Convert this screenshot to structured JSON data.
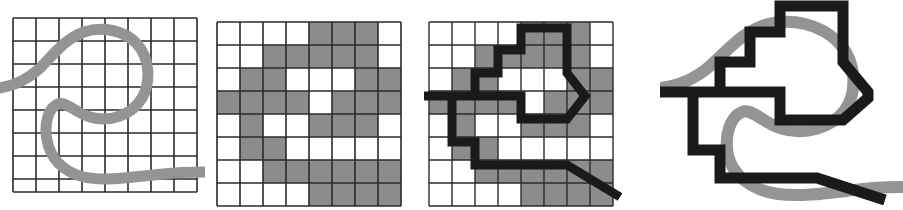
{
  "figure": {
    "panel_count": 4,
    "background_color": "#ffffff"
  },
  "colors": {
    "grid_line": "#2b2b2b",
    "curve_gray": "#949494",
    "cell_fill_gray": "#8c8c8c",
    "polyline_black": "#1a1a1a",
    "background": "#ffffff"
  },
  "panels": [
    {
      "id": "panel-1",
      "name": "original-curve-on-grid",
      "label": "Original curve over grid",
      "grid": {
        "cols": 8,
        "rows": 8,
        "cell": 23,
        "x": 13,
        "y": 18,
        "show_lines": true
      },
      "shows": [
        "grid",
        "gray-curve"
      ]
    },
    {
      "id": "panel-2",
      "name": "rasterized-cells",
      "label": "Rasterized cells",
      "grid": {
        "cols": 8,
        "rows": 8,
        "cell": 23,
        "x": 217,
        "y": 22,
        "show_lines": true
      },
      "shows": [
        "grid",
        "filled-cells"
      ]
    },
    {
      "id": "panel-3",
      "name": "traced-polyline-on-cells",
      "label": "Boundary polyline over rasterized cells",
      "grid": {
        "cols": 8,
        "rows": 8,
        "cell": 23,
        "x": 429,
        "y": 22,
        "show_lines": true
      },
      "shows": [
        "grid",
        "filled-cells",
        "black-polyline",
        "gray-curve"
      ]
    },
    {
      "id": "panel-4",
      "name": "result-overlay",
      "label": "Result: polyline and original curve",
      "grid": {
        "cols": 8,
        "rows": 8,
        "cell": 23,
        "x": 0,
        "y": 0,
        "show_lines": false
      },
      "shows": [
        "gray-curve",
        "black-polyline"
      ]
    }
  ],
  "chart_data": {
    "type": "diagram",
    "grid": {
      "cols": 8,
      "rows": 8,
      "cell_size": 23
    },
    "curve_stroke_width": 11,
    "polyline_stroke_width": 9,
    "filled_cells": [
      [
        0,
        0,
        0,
        0,
        1,
        1,
        1,
        0
      ],
      [
        0,
        0,
        1,
        1,
        1,
        1,
        1,
        0
      ],
      [
        0,
        1,
        1,
        0,
        0,
        0,
        1,
        1
      ],
      [
        1,
        1,
        1,
        1,
        0,
        1,
        1,
        1
      ],
      [
        0,
        1,
        0,
        0,
        1,
        1,
        1,
        0
      ],
      [
        0,
        1,
        1,
        0,
        0,
        0,
        0,
        0
      ],
      [
        0,
        0,
        1,
        1,
        1,
        1,
        1,
        1
      ],
      [
        0,
        0,
        0,
        0,
        1,
        1,
        1,
        1
      ]
    ],
    "curve_points_cellspace": [
      [
        -0.6,
        3.05
      ],
      [
        0.55,
        2.95
      ],
      [
        1.5,
        2.45
      ],
      [
        2.4,
        1.55
      ],
      [
        3.3,
        0.85
      ],
      [
        4.4,
        0.6
      ],
      [
        5.5,
        0.8
      ],
      [
        6.3,
        1.5
      ],
      [
        6.55,
        2.5
      ],
      [
        6.2,
        3.5
      ],
      [
        5.3,
        4.1
      ],
      [
        4.2,
        4.3
      ],
      [
        3.1,
        4.1
      ],
      [
        2.2,
        3.55
      ],
      [
        1.6,
        3.9
      ],
      [
        1.35,
        4.8
      ],
      [
        1.5,
        5.8
      ],
      [
        2.1,
        6.6
      ],
      [
        3.1,
        7.0
      ],
      [
        4.4,
        7.0
      ],
      [
        5.6,
        6.85
      ],
      [
        6.6,
        6.75
      ],
      [
        7.9,
        6.7
      ]
    ],
    "polyline_points_cellspace": [
      [
        -0.4,
        3.2
      ],
      [
        2.0,
        3.2
      ],
      [
        2.0,
        2.2
      ],
      [
        3.0,
        2.2
      ],
      [
        3.0,
        1.2
      ],
      [
        4.0,
        1.2
      ],
      [
        4.0,
        0.25
      ],
      [
        6.0,
        0.25
      ],
      [
        6.0,
        2.2
      ],
      [
        6.8,
        3.2
      ],
      [
        6.0,
        4.2
      ],
      [
        4.0,
        4.2
      ],
      [
        4.0,
        3.2
      ],
      [
        2.0,
        3.2
      ],
      [
        1.2,
        3.2
      ],
      [
        1.2,
        5.2
      ],
      [
        2.0,
        5.2
      ],
      [
        2.0,
        6.2
      ],
      [
        6.0,
        6.2
      ],
      [
        8.3,
        7.6
      ]
    ],
    "legend": [],
    "annotations": []
  }
}
